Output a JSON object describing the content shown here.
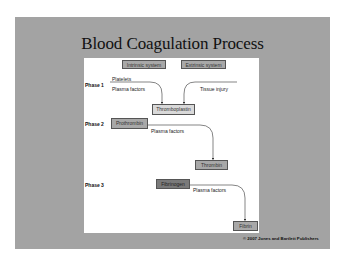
{
  "slide": {
    "title": "Blood Coagulation Process",
    "copyright": "© 2007 Jones and Bartlett Publishers",
    "colors": {
      "slide_bg": "#a3a3a3",
      "panel_bg": "#ffffff",
      "box_mid": "#a8a8a8",
      "box_light": "#d9d9d9",
      "box_dark": "#7a7a7a"
    }
  },
  "diagram": {
    "top_boxes": [
      "Intrinsic system",
      "Extrinsic system"
    ],
    "phases": [
      {
        "label": "Phase 1",
        "inputs_left": [
          "Platelets",
          "Plasma factors"
        ],
        "inputs_right": [
          "Tissue injury"
        ],
        "product": "Thromboplastin"
      },
      {
        "label": "Phase 2",
        "substrate": "Prothrombin",
        "factor": "Plasma factors",
        "product": "Thrombin"
      },
      {
        "label": "Phase 3",
        "substrate": "Fibrinogen",
        "factor": "Plasma factors",
        "product": "Fibrin"
      }
    ]
  }
}
